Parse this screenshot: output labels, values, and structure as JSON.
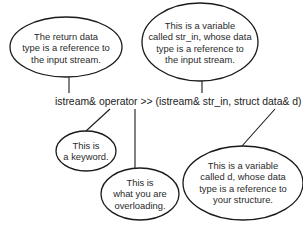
{
  "diagram": {
    "code_line": "istream& operator >> (istream& str_in, struct data& d)",
    "callouts": [
      {
        "id": "return-type",
        "lines": [
          "The return data",
          "type is a reference to",
          "the input stream."
        ],
        "points_to": "istream&"
      },
      {
        "id": "str-in",
        "lines": [
          "This is a variable",
          "called str_in, whose data",
          "type is a reference to",
          "the input stream."
        ],
        "points_to": "istream& str_in"
      },
      {
        "id": "keyword",
        "lines": [
          "This is",
          "a keyword."
        ],
        "points_to": "operator"
      },
      {
        "id": "overloading",
        "lines": [
          "This is",
          "what you are",
          "overloading."
        ],
        "points_to": ">>"
      },
      {
        "id": "d-var",
        "lines": [
          "This is a variable",
          "called d, whose data",
          "type is a reference to",
          "your structure."
        ],
        "points_to": "struct data& d"
      }
    ],
    "colors": {
      "stroke": "#1a1a1a",
      "background": "#ffffff",
      "text": "#222222"
    }
  }
}
